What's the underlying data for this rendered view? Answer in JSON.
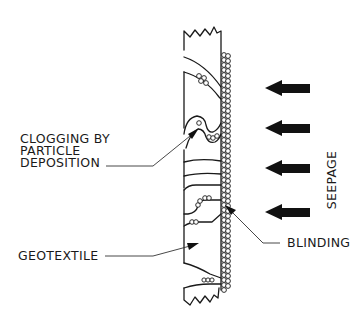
{
  "diagram": {
    "title": "",
    "labels": {
      "clogging_line1": "CLOGGING BY",
      "clogging_line2": "PARTICLE",
      "clogging_line3": "DEPOSITION",
      "geotextile": "GEOTEXTILE",
      "blinding": "BLINDING",
      "seepage": "SEEPAGE"
    },
    "seepage_arrows": {
      "count": 4,
      "direction": "left",
      "color": "#111111",
      "y_positions": [
        88,
        128,
        168,
        210
      ]
    },
    "elements": [
      {
        "id": "geotextile-strip",
        "type": "section",
        "description": "vertical geotextile cross-section with broken ends"
      },
      {
        "id": "soil-particles",
        "type": "particle-column",
        "description": "soil particles accumulated along upstream face"
      },
      {
        "id": "clogging-zone",
        "type": "deposition",
        "description": "particles deposited inside pore openings"
      },
      {
        "id": "blinding-zone",
        "type": "surface-layer",
        "description": "particles blocking surface openings"
      }
    ],
    "colors": {
      "line": "#1a1a1a",
      "background": "#ffffff"
    }
  }
}
